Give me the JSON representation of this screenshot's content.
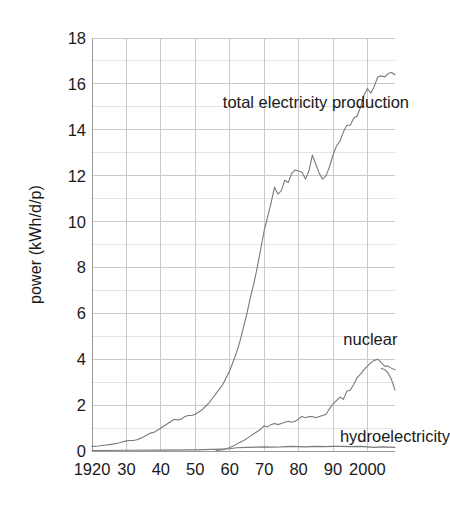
{
  "chart_data": {
    "type": "line",
    "title": "",
    "xlabel": "",
    "ylabel": "power (kWh/d/p)",
    "xlim": [
      1920,
      2008
    ],
    "ylim": [
      0,
      18
    ],
    "grid": true,
    "legend_position": "inline-annotations",
    "x_ticks": [
      {
        "value": 1920,
        "label": "1920"
      },
      {
        "value": 1930,
        "label": "30"
      },
      {
        "value": 1940,
        "label": "40"
      },
      {
        "value": 1950,
        "label": "50"
      },
      {
        "value": 1960,
        "label": "60"
      },
      {
        "value": 1970,
        "label": "70"
      },
      {
        "value": 1980,
        "label": "80"
      },
      {
        "value": 1990,
        "label": "90"
      },
      {
        "value": 2000,
        "label": "2000"
      }
    ],
    "y_ticks": [
      {
        "value": 0,
        "label": "0"
      },
      {
        "value": 2,
        "label": "2"
      },
      {
        "value": 4,
        "label": "4"
      },
      {
        "value": 6,
        "label": "6"
      },
      {
        "value": 8,
        "label": "8"
      },
      {
        "value": 10,
        "label": "10"
      },
      {
        "value": 12,
        "label": "12"
      },
      {
        "value": 14,
        "label": "14"
      },
      {
        "value": 16,
        "label": "16"
      },
      {
        "value": 18,
        "label": "18"
      }
    ],
    "y_minor_ticks": [
      1,
      3,
      5,
      7,
      9,
      11,
      13,
      15,
      17
    ],
    "annotations": [
      {
        "text": "total electricity production",
        "x": 1958,
        "y": 15.2
      },
      {
        "text": "nuclear",
        "x": 1993,
        "y": 4.9
      },
      {
        "text": "hydroelectricity",
        "x": 1992,
        "y": 0.65
      }
    ],
    "series": [
      {
        "name": "total electricity production",
        "color": "#7a7a7a",
        "x": [
          1920,
          1921,
          1922,
          1923,
          1924,
          1925,
          1926,
          1927,
          1928,
          1929,
          1930,
          1931,
          1932,
          1933,
          1934,
          1935,
          1936,
          1937,
          1938,
          1939,
          1940,
          1941,
          1942,
          1943,
          1944,
          1945,
          1946,
          1947,
          1948,
          1949,
          1950,
          1951,
          1952,
          1953,
          1954,
          1955,
          1956,
          1957,
          1958,
          1959,
          1960,
          1961,
          1962,
          1963,
          1964,
          1965,
          1966,
          1967,
          1968,
          1969,
          1970,
          1971,
          1972,
          1973,
          1974,
          1975,
          1976,
          1977,
          1978,
          1979,
          1980,
          1981,
          1982,
          1983,
          1984,
          1985,
          1986,
          1987,
          1988,
          1989,
          1990,
          1991,
          1992,
          1993,
          1994,
          1995,
          1996,
          1997,
          1998,
          1999,
          2000,
          2001,
          2002,
          2003,
          2004,
          2005,
          2006,
          2007,
          2008
        ],
        "y": [
          0.2,
          0.21,
          0.22,
          0.24,
          0.26,
          0.28,
          0.3,
          0.33,
          0.36,
          0.4,
          0.44,
          0.46,
          0.46,
          0.49,
          0.55,
          0.62,
          0.7,
          0.78,
          0.82,
          0.9,
          1.0,
          1.1,
          1.2,
          1.3,
          1.38,
          1.35,
          1.4,
          1.5,
          1.55,
          1.55,
          1.6,
          1.7,
          1.8,
          1.95,
          2.1,
          2.3,
          2.5,
          2.7,
          2.9,
          3.2,
          3.5,
          3.9,
          4.3,
          4.8,
          5.4,
          6.0,
          6.7,
          7.3,
          8.0,
          8.8,
          9.6,
          10.2,
          10.8,
          11.5,
          11.2,
          11.35,
          11.8,
          11.7,
          12.1,
          12.25,
          12.2,
          12.15,
          11.85,
          12.2,
          12.9,
          12.5,
          12.1,
          11.85,
          12.0,
          12.4,
          12.9,
          13.3,
          13.5,
          13.9,
          14.2,
          14.2,
          14.5,
          14.6,
          15.0,
          15.5,
          15.8,
          15.6,
          15.9,
          16.3,
          16.35,
          16.3,
          16.45,
          16.5,
          16.4
        ]
      },
      {
        "name": "nuclear",
        "color": "#7a7a7a",
        "x": [
          1956,
          1957,
          1958,
          1959,
          1960,
          1961,
          1962,
          1963,
          1964,
          1965,
          1966,
          1967,
          1968,
          1969,
          1970,
          1971,
          1972,
          1973,
          1974,
          1975,
          1976,
          1977,
          1978,
          1979,
          1980,
          1981,
          1982,
          1983,
          1984,
          1985,
          1986,
          1987,
          1988,
          1989,
          1990,
          1991,
          1992,
          1993,
          1994,
          1995,
          1996,
          1997,
          1998,
          1999,
          2000,
          2001,
          2002,
          2003,
          2004,
          2005,
          2006,
          2007,
          2008
        ],
        "y": [
          0.02,
          0.04,
          0.06,
          0.1,
          0.15,
          0.22,
          0.3,
          0.38,
          0.45,
          0.55,
          0.65,
          0.75,
          0.85,
          0.95,
          1.1,
          1.05,
          1.15,
          1.2,
          1.15,
          1.2,
          1.25,
          1.3,
          1.25,
          1.3,
          1.4,
          1.5,
          1.45,
          1.5,
          1.5,
          1.45,
          1.5,
          1.55,
          1.6,
          1.85,
          2.05,
          2.2,
          2.35,
          2.25,
          2.6,
          2.65,
          2.9,
          3.2,
          3.35,
          3.55,
          3.7,
          3.85,
          3.95,
          4.0,
          3.85,
          3.7,
          3.7,
          3.6,
          3.55
        ]
      },
      {
        "name": "nuclear_tail",
        "color": "#7a7a7a",
        "x": [
          2004,
          2005,
          2006,
          2007,
          2008
        ],
        "y": [
          3.6,
          3.55,
          3.4,
          3.1,
          2.65
        ]
      },
      {
        "name": "hydroelectricity",
        "color": "#7a7a7a",
        "x": [
          1920,
          1930,
          1940,
          1950,
          1955,
          1960,
          1962,
          1965,
          1968,
          1970,
          1972,
          1975,
          1978,
          1980,
          1982,
          1985,
          1988,
          1990,
          1992,
          1995,
          1998,
          2000,
          2002,
          2004,
          2006,
          2008
        ],
        "y": [
          0.02,
          0.03,
          0.04,
          0.05,
          0.07,
          0.1,
          0.14,
          0.16,
          0.17,
          0.18,
          0.17,
          0.18,
          0.2,
          0.19,
          0.18,
          0.2,
          0.19,
          0.2,
          0.2,
          0.19,
          0.2,
          0.18,
          0.16,
          0.18,
          0.17,
          0.16
        ]
      }
    ]
  },
  "plot": {
    "left_px": 92,
    "right_px": 395,
    "top_px": 38,
    "bottom_px": 451,
    "grid_color": "#c9c9c9",
    "axis_color": "#9a9a9a",
    "curve_color": "#7a7a7a"
  }
}
